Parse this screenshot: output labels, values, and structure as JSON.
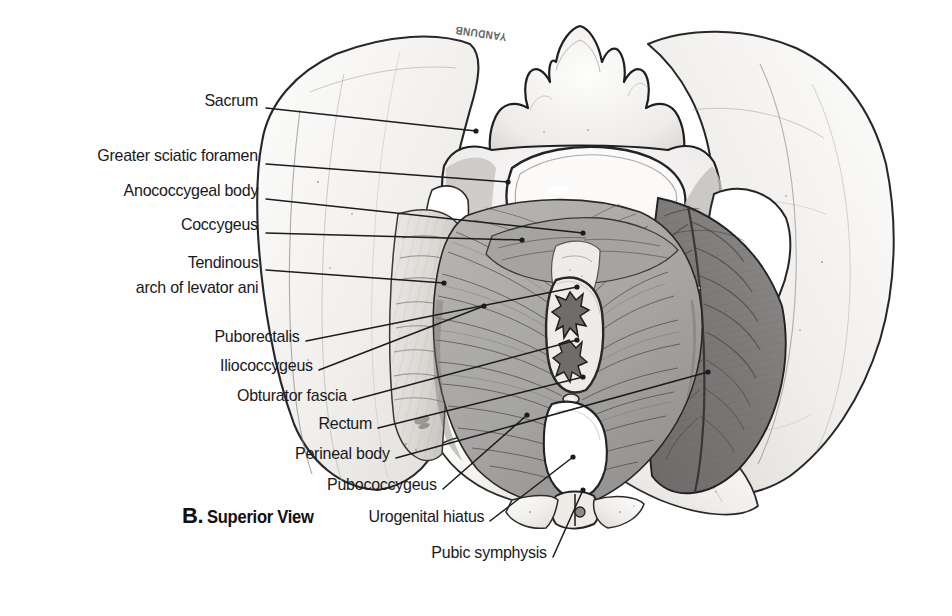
{
  "figure": {
    "caption_letter": "B.",
    "caption_words": "Superior View",
    "artist_signature": "YANDUNB",
    "colors": {
      "ink": "#19191b",
      "leader": "#1c1c1e",
      "bone_light": "#f2f1ef",
      "bone_shade": "#d9d7d4",
      "muscle_mid": "#9b9a98",
      "muscle_dark": "#747372",
      "page": "#fefefe"
    }
  },
  "labels": [
    {
      "id": "sacrum",
      "text": "Sacrum",
      "align": "right",
      "x": 258,
      "y": 100,
      "tip_x": 476,
      "tip_y": 131
    },
    {
      "id": "greater-sciatic-foramen",
      "text": "Greater sciatic foramen",
      "align": "right",
      "x": 258,
      "y": 155,
      "tip_x": 508,
      "tip_y": 182
    },
    {
      "id": "anococcygeal-body",
      "text": "Anococcygeal body",
      "align": "right",
      "x": 258,
      "y": 190,
      "tip_x": 583,
      "tip_y": 233
    },
    {
      "id": "coccygeus",
      "text": "Coccygeus",
      "align": "right",
      "x": 258,
      "y": 224,
      "tip_x": 522,
      "tip_y": 240
    },
    {
      "id": "tendinous-arch-of-levator-ani",
      "text": "Tendinous\narch of levator ani",
      "align": "right",
      "x": 258,
      "y": 260,
      "tip_x": 444,
      "tip_y": 283
    },
    {
      "id": "puborectalis",
      "text": "Puborectalis",
      "align": "right",
      "x": 300,
      "y": 335,
      "tip_x": 577,
      "tip_y": 287
    },
    {
      "id": "iliococcygeus",
      "text": "Iliococcygeus",
      "align": "right",
      "x": 313,
      "y": 364,
      "tip_x": 484,
      "tip_y": 306
    },
    {
      "id": "obturator-fascia",
      "text": "Obturator fascia",
      "align": "right",
      "x": 347,
      "y": 394,
      "tip_x": 577,
      "tip_y": 340
    },
    {
      "id": "rectum",
      "text": "Rectum",
      "align": "right",
      "x": 372,
      "y": 422,
      "tip_x": 583,
      "tip_y": 377
    },
    {
      "id": "perineal-body",
      "text": "Perineal body",
      "align": "right",
      "x": 390,
      "y": 452,
      "tip_x": 708,
      "tip_y": 372
    },
    {
      "id": "pubococcygeus",
      "text": "Pubococcygeus",
      "align": "right",
      "x": 437,
      "y": 483,
      "tip_x": 527,
      "tip_y": 415
    },
    {
      "id": "urogenital-hiatus",
      "text": "Urogenital hiatus",
      "align": "right",
      "x": 484,
      "y": 515,
      "tip_x": 573,
      "tip_y": 457
    },
    {
      "id": "pubic-symphysis",
      "text": "Pubic symphysis",
      "align": "right",
      "x": 547,
      "y": 551,
      "tip_x": 583,
      "tip_y": 490
    }
  ],
  "structures": [
    {
      "id": "left-ilium",
      "name": "left iliac wing (bone)"
    },
    {
      "id": "right-ilium",
      "name": "right iliac wing (bone)"
    },
    {
      "id": "sacrum-body",
      "name": "sacrum with spinous processes"
    },
    {
      "id": "sacral-promontory",
      "name": "sacral promontory / S1 body"
    },
    {
      "id": "left-obturator-internus",
      "name": "left obturator internus with fascia"
    },
    {
      "id": "right-obturator-internus",
      "name": "right obturator internus with fascia"
    },
    {
      "id": "levator-ani-sheet",
      "name": "levator ani (pubococcygeus / iliococcygeus)"
    },
    {
      "id": "coccygeus-muscle",
      "name": "coccygeus muscle"
    },
    {
      "id": "anorectal-canal",
      "name": "rectum (anorectal junction)"
    },
    {
      "id": "urogenital-hiatus-gap",
      "name": "urogenital hiatus aperture"
    },
    {
      "id": "pubic-symphysis-joint",
      "name": "pubic symphysis"
    },
    {
      "id": "left-greater-sciatic-foramen",
      "name": "left greater sciatic foramen"
    },
    {
      "id": "right-greater-sciatic-foramen",
      "name": "right greater sciatic foramen"
    }
  ]
}
